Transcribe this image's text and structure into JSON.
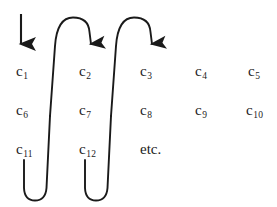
{
  "figure": {
    "background_color": "#ffffff",
    "ink_color": "#1b1b1b",
    "stroke_color": "#1a1a1a"
  },
  "grid": {
    "columns": 5,
    "rows": 3,
    "column_x": [
      16,
      79,
      140,
      195,
      248
    ],
    "row_y": [
      71,
      110,
      149
    ],
    "cells": [
      [
        {
          "base": "c",
          "sub": "1",
          "label": "c1"
        },
        {
          "base": "c",
          "sub": "2",
          "label": "c2"
        },
        {
          "base": "c",
          "sub": "3",
          "label": "c3"
        },
        {
          "base": "c",
          "sub": "4",
          "label": "c4"
        },
        {
          "base": "c",
          "sub": "5",
          "label": "c5"
        }
      ],
      [
        {
          "base": "c",
          "sub": "6",
          "label": "c6"
        },
        {
          "base": "c",
          "sub": "7",
          "label": "c7"
        },
        {
          "base": "c",
          "sub": "8",
          "label": "c8"
        },
        {
          "base": "c",
          "sub": "9",
          "label": "c9"
        },
        {
          "base": "c",
          "sub": "10",
          "label": "c10"
        }
      ],
      [
        {
          "base": "c",
          "sub": "11",
          "label": "c11"
        },
        {
          "base": "c",
          "sub": "12",
          "label": "c12"
        }
      ]
    ],
    "etc_label": "etc."
  },
  "annotations": {
    "entry_arrow": {
      "name": "entry-down-arrow",
      "description": "straight vertical arrow entering column 1",
      "x": 21,
      "y_start": 14,
      "y_end": 50
    },
    "top_arcs": [
      {
        "name": "arc-col1-to-col2",
        "description": "arc from column 1 up and over into column 2",
        "apex_y": 17,
        "x_left": 55,
        "x_right": 90
      },
      {
        "name": "arc-col2-to-col3",
        "description": "arc from column 2 up and over into column 3",
        "apex_y": 17,
        "x_left": 116,
        "x_right": 151
      }
    ],
    "bottom_curves": [
      {
        "name": "u-turn-col1-bottom",
        "description": "U-turn at bottom of column 1 back up into column 2",
        "x_left": 22,
        "x_right": 48,
        "bottom_y": 197
      },
      {
        "name": "u-turn-col2-bottom",
        "description": "U-turn at bottom of column 2 back up into column 3",
        "x_left": 83,
        "x_right": 109,
        "bottom_y": 197
      }
    ]
  }
}
